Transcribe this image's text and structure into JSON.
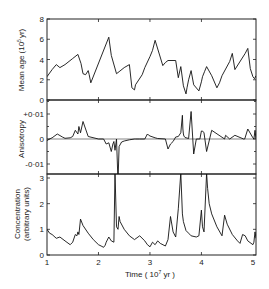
{
  "chart_data": {
    "type": "line",
    "layout": "three vertically stacked panels sharing x-axis",
    "xlabel": "Time  ( 10^7 yr )",
    "x_ticks": [
      "1",
      "2",
      "3",
      "4",
      "5"
    ],
    "xlim": [
      1,
      5.06
    ],
    "grid": false,
    "legend": null,
    "panels": [
      {
        "name": "mean-age",
        "ylabel": "Mean age  (10^5 yr)",
        "y_ticks": [
          "0",
          "2",
          "4",
          "6",
          "8"
        ],
        "ylim": [
          0,
          8
        ],
        "series": [
          {
            "name": "Mean age",
            "x": [
              1.0,
              1.1,
              1.18,
              1.25,
              1.35,
              1.5,
              1.6,
              1.66,
              1.7,
              1.75,
              1.8,
              1.82,
              1.85,
              2.2,
              2.25,
              2.35,
              2.4,
              2.5,
              2.6,
              2.65,
              2.7,
              2.72,
              2.85,
              2.9,
              3.0,
              3.05,
              3.1,
              3.25,
              3.3,
              3.35,
              3.5,
              3.55,
              3.6,
              3.65,
              3.7,
              3.72,
              3.75,
              3.8,
              3.85,
              3.95,
              4.0,
              4.02,
              4.06,
              4.1,
              4.2,
              4.3,
              4.35,
              4.4,
              4.55,
              4.6,
              4.65,
              4.85,
              4.9,
              4.95,
              5.0,
              5.03,
              5.06
            ],
            "y": [
              2.3,
              3.0,
              3.5,
              3.2,
              3.5,
              4.1,
              4.5,
              3.6,
              2.6,
              2.5,
              2.9,
              2.5,
              1.7,
              6.2,
              4.4,
              2.6,
              2.8,
              3.2,
              3.5,
              1.2,
              1.0,
              1.5,
              2.5,
              3.2,
              4.3,
              4.9,
              5.9,
              3.4,
              3.7,
              3.9,
              3.9,
              2.2,
              3.3,
              1.4,
              0.6,
              1.2,
              2.0,
              2.9,
              1.5,
              0.9,
              1.8,
              2.3,
              2.8,
              3.3,
              2.4,
              1.2,
              1.7,
              2.4,
              3.8,
              4.6,
              3.0,
              4.6,
              5.1,
              3.1,
              2.3,
              2.1,
              2.4
            ]
          }
        ]
      },
      {
        "name": "anisotropy",
        "ylabel": "Anisotropy",
        "y_ticks": [
          "-0.01",
          "0",
          "+0.01"
        ],
        "ylim": [
          -0.016,
          0.015
        ],
        "series": [
          {
            "name": "Anisotropy",
            "x": [
              1.0,
              1.05,
              1.1,
              1.2,
              1.3,
              1.35,
              1.45,
              1.5,
              1.55,
              1.6,
              1.62,
              1.65,
              1.7,
              1.8,
              2.0,
              2.1,
              2.15,
              2.2,
              2.25,
              2.28,
              2.3,
              2.32,
              2.35,
              2.38,
              2.4,
              2.45,
              2.5,
              2.6,
              2.7,
              2.72,
              2.8,
              2.9,
              2.95,
              2.97,
              3.0,
              3.1,
              3.15,
              3.3,
              3.35,
              3.4,
              3.45,
              3.5,
              3.55,
              3.6,
              3.63,
              3.64,
              3.65,
              3.66,
              3.68,
              3.75,
              3.8,
              3.85,
              3.9,
              3.95,
              3.97,
              4.0,
              4.02,
              4.05,
              4.1,
              4.2,
              4.45,
              4.47,
              4.55,
              4.65,
              4.82,
              4.84,
              4.9,
              5.0,
              5.02,
              5.04,
              5.06
            ],
            "y": [
              -0.0006,
              0.0,
              0.0005,
              0.002,
              0.0008,
              0.0003,
              0.0005,
              0.001,
              0.0035,
              0.002,
              0.005,
              0.0025,
              0.007,
              0.001,
              0.0,
              0.0,
              -0.002,
              -0.0015,
              -0.005,
              -0.002,
              -0.001,
              -0.0045,
              -0.0,
              -0.017,
              -0.003,
              -0.0012,
              -0.0008,
              -0.0003,
              0.0,
              0.0,
              0.0,
              0.0,
              0.002,
              0.0016,
              0.0012,
              0.0005,
              0.0002,
              0.0,
              -0.004,
              -0.002,
              -0.001,
              0.0008,
              0.001,
              0.0025,
              0.0095,
              0.004,
              0.002,
              0.0012,
              0.0006,
              0.0002,
              0.011,
              -0.006,
              0.0,
              0.0,
              0.0,
              0.0032,
              0.0032,
              0.0025,
              -0.005,
              0.0035,
              0.0,
              0.0015,
              0.0,
              0.0015,
              0.0,
              0.0,
              0.004,
              0.0005,
              0.0,
              0.0035,
              0.0
            ]
          }
        ]
      },
      {
        "name": "concentration",
        "ylabel": "Concentration (arbitrary units)",
        "y_ticks": [
          "0",
          "1",
          "2",
          "3"
        ],
        "ylim": [
          0,
          3.15
        ],
        "series": [
          {
            "name": "Concentration",
            "x": [
              1.0,
              1.05,
              1.1,
              1.18,
              1.25,
              1.35,
              1.45,
              1.5,
              1.55,
              1.58,
              1.6,
              1.62,
              1.65,
              1.7,
              1.8,
              1.9,
              2.0,
              2.05,
              2.1,
              2.13,
              2.15,
              2.2,
              2.25,
              2.3,
              2.32,
              2.35,
              2.38,
              2.4,
              2.42,
              2.5,
              2.6,
              2.7,
              2.8,
              2.9,
              2.95,
              3.0,
              3.05,
              3.1,
              3.15,
              3.2,
              3.3,
              3.35,
              3.4,
              3.45,
              3.5,
              3.55,
              3.6,
              3.63,
              3.65,
              3.7,
              3.75,
              3.8,
              3.9,
              3.95,
              4.0,
              4.02,
              4.05,
              4.1,
              4.12,
              4.15,
              4.2,
              4.3,
              4.4,
              4.45,
              4.5,
              4.6,
              4.7,
              4.75,
              4.8,
              4.85,
              4.9,
              5.0,
              5.02,
              5.04,
              5.06
            ],
            "y": [
              1.0,
              0.85,
              0.8,
              0.65,
              0.7,
              0.55,
              0.4,
              0.5,
              0.8,
              0.75,
              0.9,
              0.8,
              1.4,
              1.15,
              0.85,
              0.6,
              0.4,
              0.35,
              0.3,
              0.38,
              0.5,
              0.7,
              0.55,
              0.5,
              3.2,
              1.1,
              1.0,
              1.5,
              1.3,
              1.0,
              0.75,
              0.6,
              0.75,
              0.55,
              0.4,
              0.32,
              0.5,
              0.4,
              0.55,
              0.45,
              0.35,
              0.6,
              1.5,
              0.9,
              0.7,
              1.8,
              3.2,
              1.6,
              1.3,
              0.95,
              0.85,
              0.75,
              0.7,
              0.75,
              1.75,
              1.1,
              0.9,
              3.2,
              2.6,
              2.0,
              1.6,
              1.1,
              0.75,
              1.55,
              1.2,
              0.8,
              0.55,
              0.45,
              0.8,
              0.75,
              0.55,
              0.4,
              0.5,
              0.9,
              0.65
            ]
          }
        ]
      }
    ]
  },
  "labels": {
    "panel1_ylabel": "Mean age (10",
    "panel1_ylabel_sup": "5",
    "panel1_ylabel_end": "yr)",
    "panel2_ylabel": "Anisotropy",
    "panel3_ylabel_line1": "Concentration",
    "panel3_ylabel_line2": "(arbitrary units)",
    "xlabel_pre": "Time  ( 10",
    "xlabel_sup": "7",
    "xlabel_post": " yr )"
  }
}
